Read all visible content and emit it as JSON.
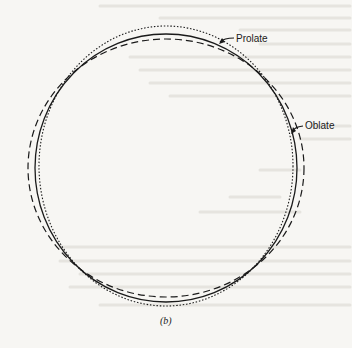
{
  "figure": {
    "caption": "(b)",
    "center": {
      "x": 166,
      "y": 166
    },
    "curves": [
      {
        "name": "sphere",
        "style": "solid",
        "rx": 131,
        "ry": 133,
        "color": "#1a1a1a"
      },
      {
        "name": "prolate",
        "style": "dotted",
        "rx": 126,
        "ry": 140,
        "color": "#1a1a1a"
      },
      {
        "name": "oblate",
        "style": "dashed",
        "rx": 138,
        "ry": 128,
        "color": "#1a1a1a"
      }
    ],
    "labels": {
      "prolate": "Prolate",
      "oblate": "Oblate"
    }
  }
}
